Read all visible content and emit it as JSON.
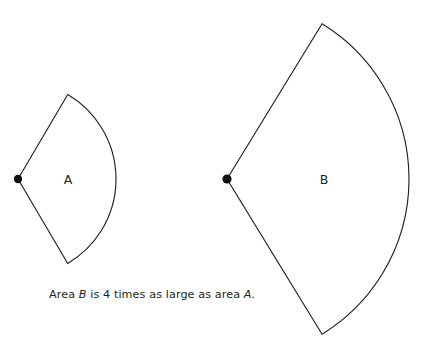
{
  "figure": {
    "background_color": "#ffffff",
    "stroke_color": "#231f20",
    "dot_color": "#111111",
    "clipped_top_line": "is a sector of a circle",
    "shapes": [
      {
        "id": "sector-a",
        "label": "A",
        "label_x": 68,
        "label_y": 180,
        "vertex_x": 18,
        "vertex_y": 179,
        "radius": 98,
        "half_angle_deg": 59.5,
        "dot_radius": 4.2,
        "relative_area": 1
      },
      {
        "id": "sector-b",
        "label": "B",
        "label_x": 324,
        "label_y": 180,
        "vertex_x": 227,
        "vertex_y": 179,
        "radius": 182,
        "half_angle_deg": 58.5,
        "dot_radius": 4.6,
        "relative_area": 4
      }
    ]
  },
  "caption": {
    "part1": "Area ",
    "em1": "B",
    "part2": " is 4 times as large as area ",
    "em2": "A",
    "part3": "."
  }
}
